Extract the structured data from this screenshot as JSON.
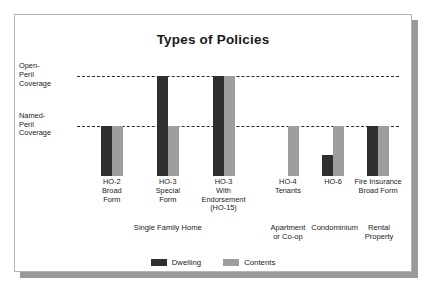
{
  "chart_data": {
    "type": "bar",
    "title": "Types of Policies",
    "xlabel": "",
    "ylabel": "",
    "grid": true,
    "legend_position": "bottom",
    "y_reference_lines": [
      {
        "label": "Open-\nPeril\nCoverage",
        "value": 2
      },
      {
        "label": "Named-\nPeril\nCoverage",
        "value": 1
      }
    ],
    "ylim": [
      0,
      2.35
    ],
    "categories": [
      "HO-2\nBroad\nForm",
      "HO-3\nSpecial\nForm",
      "HO-3\nWith\nEndorsement\n(HO-15)",
      "HO-4\nTenants",
      "HO-6",
      "Fire Insurance\nBroad Form"
    ],
    "series": [
      {
        "name": "Dwelling",
        "color": "#2f2f2f",
        "values": [
          1,
          2,
          2,
          0,
          0.42,
          1
        ]
      },
      {
        "name": "Contents",
        "color": "#9d9d9d",
        "values": [
          1,
          1,
          2,
          1,
          1,
          1
        ]
      }
    ],
    "groups": [
      {
        "label": "Single Family Home",
        "categories": [
          "HO-2 Broad Form",
          "HO-3 Special Form",
          "HO-3 With Endorsement (HO-15)"
        ]
      },
      {
        "label": "Apartment\nor Co-op",
        "categories": [
          "HO-4 Tenants"
        ]
      },
      {
        "label": "Condominium",
        "categories": [
          "HO-6"
        ]
      },
      {
        "label": "Rental\nProperty",
        "categories": [
          "Fire Insurance Broad Form"
        ]
      }
    ]
  },
  "legend": [
    {
      "label": "Dwelling",
      "color": "#2f2f2f"
    },
    {
      "label": "Contents",
      "color": "#9d9d9d"
    }
  ]
}
